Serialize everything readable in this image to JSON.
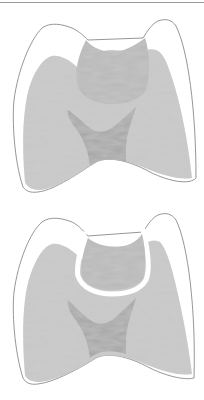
{
  "figure": {
    "panels": [
      {
        "id": "tooth-carious-lesion",
        "description": "Tooth cross-section with carious lesion in dentin"
      },
      {
        "id": "tooth-cavity-preparation",
        "description": "Tooth cross-section with cavity preparation outline around lesion"
      }
    ],
    "colors": {
      "enamel": "#ffffff",
      "outline": "#8a8a8a",
      "dentin": "#c8c8c8",
      "pulp": "#a4a4a4",
      "lesion": "#b6b6b6",
      "preparation_border": "#ffffff"
    }
  }
}
